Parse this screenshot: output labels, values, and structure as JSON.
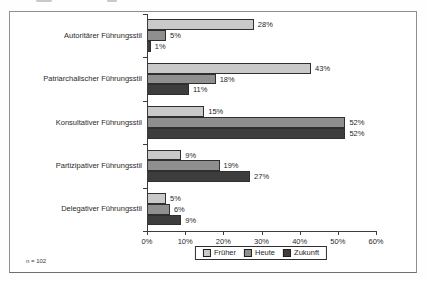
{
  "chart_frame": {
    "footnote": "n = 102"
  },
  "chart_data": {
    "type": "bar",
    "orientation": "horizontal",
    "title": "",
    "categories": [
      "Autoritärer Führungsstil",
      "Patriarchalischer Führungsstil",
      "Konsultativer Führungsstil",
      "Partizipativer Führungsstil",
      "Delegativer Führungsstil"
    ],
    "series": [
      {
        "name": "Früher",
        "color": "#c9c9c9",
        "values": [
          28,
          43,
          15,
          9,
          5
        ]
      },
      {
        "name": "Heute",
        "color": "#8f8f8f",
        "values": [
          5,
          18,
          52,
          19,
          6
        ]
      },
      {
        "name": "Zukunft",
        "color": "#3d3d3d",
        "values": [
          1,
          11,
          52,
          27,
          9
        ]
      }
    ],
    "value_label_format": "{v}%",
    "x_axis": {
      "min": 0,
      "max": 60,
      "step": 10,
      "tick_labels": [
        "0%",
        "10%",
        "20%",
        "30%",
        "40%",
        "50%",
        "60%"
      ]
    },
    "legend_position": "bottom",
    "grid": false
  }
}
